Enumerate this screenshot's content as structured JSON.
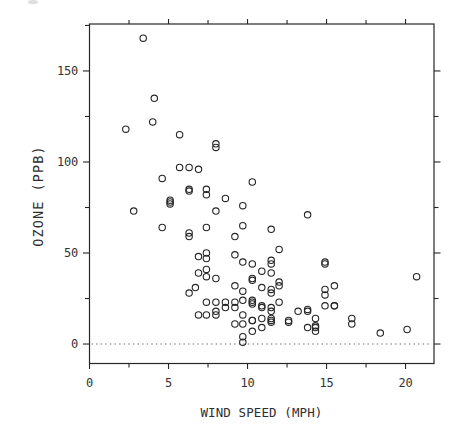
{
  "chart_data": {
    "type": "scatter",
    "title": "",
    "xlabel": "WIND SPEED (MPH)",
    "ylabel": "OZONE (PPB)",
    "marker": "open-circle",
    "grid": false,
    "legend": null,
    "xlim": [
      0,
      21.8
    ],
    "ylim": [
      -10.7,
      175.8
    ],
    "x_ticks_labeled": [
      0,
      5,
      10,
      15,
      20
    ],
    "x_ticks_minor": [
      2.5,
      7.5,
      12.5,
      17.5
    ],
    "y_ticks_labeled": [
      0,
      50,
      100,
      150
    ],
    "y_ticks_minor_left": [
      25,
      75,
      125,
      175
    ],
    "y_ticks_minor_right": [
      25,
      75,
      125
    ],
    "reference_line": {
      "y": 0,
      "style": "dotted"
    },
    "points_xy": [
      [
        7.4,
        41
      ],
      [
        8,
        36
      ],
      [
        12.6,
        12
      ],
      [
        11.5,
        18
      ],
      [
        8.6,
        23
      ],
      [
        13.8,
        19
      ],
      [
        20.1,
        8
      ],
      [
        9.7,
        16
      ],
      [
        9.2,
        11
      ],
      [
        10.9,
        14
      ],
      [
        13.2,
        18
      ],
      [
        11.5,
        14
      ],
      [
        12,
        34
      ],
      [
        18.4,
        6
      ],
      [
        11.5,
        30
      ],
      [
        9.7,
        11
      ],
      [
        9.7,
        1
      ],
      [
        16.6,
        11
      ],
      [
        9.7,
        4
      ],
      [
        12,
        32
      ],
      [
        12,
        23
      ],
      [
        14.9,
        45
      ],
      [
        5.7,
        115
      ],
      [
        7.4,
        37
      ],
      [
        9.7,
        29
      ],
      [
        13.8,
        71
      ],
      [
        11.5,
        39
      ],
      [
        8,
        23
      ],
      [
        14.9,
        21
      ],
      [
        20.7,
        37
      ],
      [
        9.2,
        20
      ],
      [
        11.5,
        12
      ],
      [
        10.3,
        13
      ],
      [
        4.1,
        135
      ],
      [
        9.2,
        49
      ],
      [
        9.2,
        32
      ],
      [
        4.6,
        64
      ],
      [
        10.9,
        40
      ],
      [
        5.1,
        77
      ],
      [
        6.3,
        97
      ],
      [
        5.7,
        97
      ],
      [
        7.4,
        85
      ],
      [
        14.3,
        10
      ],
      [
        14.9,
        27
      ],
      [
        14.3,
        7
      ],
      [
        6.9,
        48
      ],
      [
        10.3,
        35
      ],
      [
        6.3,
        61
      ],
      [
        5.1,
        79
      ],
      [
        11.5,
        63
      ],
      [
        6.9,
        16
      ],
      [
        8.6,
        80
      ],
      [
        8,
        108
      ],
      [
        8.6,
        20
      ],
      [
        12,
        52
      ],
      [
        7.4,
        82
      ],
      [
        7.4,
        50
      ],
      [
        7.4,
        64
      ],
      [
        9.2,
        59
      ],
      [
        6.9,
        39
      ],
      [
        13.8,
        9
      ],
      [
        7.4,
        16
      ],
      [
        4,
        122
      ],
      [
        10.3,
        89
      ],
      [
        8,
        110
      ],
      [
        11.5,
        44
      ],
      [
        11.5,
        28
      ],
      [
        9.7,
        65
      ],
      [
        10.3,
        22
      ],
      [
        6.3,
        59
      ],
      [
        7.4,
        23
      ],
      [
        10.9,
        31
      ],
      [
        10.3,
        44
      ],
      [
        15.5,
        21
      ],
      [
        14.3,
        9
      ],
      [
        9.7,
        45
      ],
      [
        3.4,
        168
      ],
      [
        8,
        73
      ],
      [
        9.7,
        76
      ],
      [
        2.3,
        118
      ],
      [
        6.3,
        84
      ],
      [
        6.3,
        85
      ],
      [
        6.9,
        96
      ],
      [
        5.1,
        78
      ],
      [
        2.8,
        73
      ],
      [
        4.6,
        91
      ],
      [
        7.4,
        47
      ],
      [
        15.5,
        32
      ],
      [
        10.9,
        20
      ],
      [
        10.3,
        23
      ],
      [
        10.9,
        21
      ],
      [
        9.7,
        24
      ],
      [
        14.9,
        44
      ],
      [
        15.5,
        21
      ],
      [
        6.3,
        28
      ],
      [
        6.7,
        31
      ],
      [
        10.9,
        9
      ],
      [
        11.5,
        13
      ],
      [
        11.5,
        46
      ],
      [
        13.8,
        18
      ],
      [
        10.3,
        13
      ],
      [
        10.3,
        24
      ],
      [
        8,
        16
      ],
      [
        12.6,
        13
      ],
      [
        9.2,
        23
      ],
      [
        10.3,
        36
      ],
      [
        10.3,
        7
      ],
      [
        16.6,
        14
      ],
      [
        14.9,
        30
      ],
      [
        14.3,
        14
      ],
      [
        8,
        18
      ],
      [
        11.5,
        20
      ]
    ]
  },
  "colors": {
    "ink": "#262626",
    "label": "#333333",
    "ref_dots": "#6a6a6a",
    "paper": "#ffffff"
  }
}
